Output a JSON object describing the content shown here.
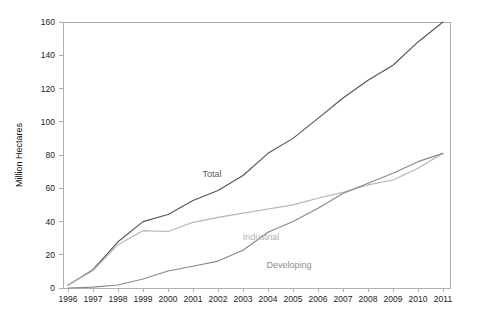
{
  "chart_data": {
    "type": "line",
    "title": "",
    "subtitle": "",
    "xlabel": "",
    "ylabel": "Million Hectares",
    "x": [
      1996,
      1997,
      1998,
      1999,
      2000,
      2001,
      2002,
      2003,
      2004,
      2005,
      2006,
      2007,
      2008,
      2009,
      2010,
      2011
    ],
    "categories": [
      "1996",
      "1997",
      "1998",
      "1999",
      "2000",
      "2001",
      "2002",
      "2003",
      "2004",
      "2005",
      "2006",
      "2007",
      "2008",
      "2009",
      "2010",
      "2011"
    ],
    "xlim": [
      1996,
      2011
    ],
    "ylim": [
      0,
      160
    ],
    "yticks": [
      0,
      20,
      40,
      60,
      80,
      100,
      120,
      140,
      160
    ],
    "ytick_labels": [
      "0",
      "20",
      "40",
      "60",
      "80",
      "100",
      "120",
      "140",
      "160"
    ],
    "xticks": [
      1996,
      1997,
      1998,
      1999,
      2000,
      2001,
      2002,
      2003,
      2004,
      2005,
      2006,
      2007,
      2008,
      2009,
      2010,
      2011
    ],
    "grid": false,
    "legend_position": "inline-annotations",
    "series": [
      {
        "name": "Total",
        "color": "#555555",
        "values": [
          1.7,
          11.0,
          27.8,
          39.9,
          44.2,
          52.6,
          58.7,
          67.7,
          81.0,
          90.0,
          102.0,
          114.3,
          125.0,
          134.0,
          148.0,
          160.0
        ]
      },
      {
        "name": "Industrial",
        "color": "#b4b4b4",
        "values": [
          1.7,
          10.5,
          26.0,
          34.5,
          34.0,
          39.5,
          42.5,
          45.0,
          47.5,
          50.0,
          54.0,
          57.5,
          62.0,
          65.0,
          72.0,
          81.0
        ]
      },
      {
        "name": "Developing",
        "color": "#888888",
        "values": [
          0.0,
          0.5,
          1.8,
          5.4,
          10.2,
          13.1,
          16.2,
          22.7,
          33.5,
          40.0,
          48.0,
          56.8,
          63.0,
          69.0,
          76.0,
          81.0
        ]
      }
    ],
    "annotations": [
      {
        "text": "Total",
        "x_px": 212,
        "y_px": 177,
        "color": "#5a5a5a"
      },
      {
        "text": "Industrial",
        "x_px": 261,
        "y_px": 240,
        "color": "#b0b0b0"
      },
      {
        "text": "Developing",
        "x_px": 289,
        "y_px": 268,
        "color": "#8c8c8c"
      }
    ]
  },
  "geometry": {
    "plot_left": 63,
    "plot_right": 450,
    "plot_top": 22,
    "plot_bottom": 288,
    "x_first_px": 68,
    "x_step_px": 25.0,
    "y_zero_px": 288,
    "y_per_unit_px": 1.6625
  }
}
